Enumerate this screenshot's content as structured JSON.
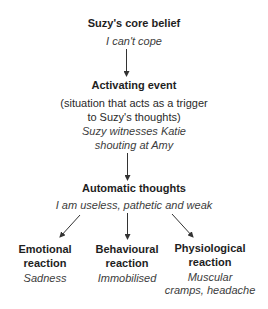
{
  "diagram": {
    "type": "flowchart",
    "core_belief": {
      "title": "Suzy's core belief",
      "content": "I can't cope"
    },
    "activating_event": {
      "title": "Activating event",
      "description_line1": "(situation that acts as a trigger",
      "description_line2": "to Suzy's thoughts)",
      "content_line1": "Suzy witnesses Katie",
      "content_line2": "shouting at Amy"
    },
    "automatic_thoughts": {
      "title": "Automatic thoughts",
      "content": "I am useless, pathetic and weak"
    },
    "reactions": [
      {
        "title_line1": "Emotional",
        "title_line2": "reaction",
        "content_line1": "Sadness",
        "content_line2": ""
      },
      {
        "title_line1": "Behavioural",
        "title_line2": "reaction",
        "content_line1": "Immobilised",
        "content_line2": ""
      },
      {
        "title_line1": "Physiological",
        "title_line2": "reaction",
        "content_line1": "Muscular",
        "content_line2": "cramps, headache"
      }
    ],
    "edges": [
      {
        "from": "core_belief",
        "to": "activating_event"
      },
      {
        "from": "activating_event",
        "to": "automatic_thoughts"
      },
      {
        "from": "automatic_thoughts",
        "to": "reactions.0"
      },
      {
        "from": "automatic_thoughts",
        "to": "reactions.1"
      },
      {
        "from": "automatic_thoughts",
        "to": "reactions.2"
      }
    ]
  }
}
